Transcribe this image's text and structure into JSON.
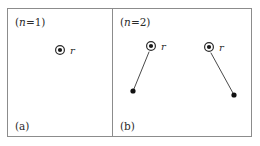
{
  "figure": {
    "width": 260,
    "height": 146,
    "background_color": "#ffffff",
    "border_color": "#8c8c8c",
    "marker_color": "#1a1a1a",
    "line_color": "#4a4a4a"
  },
  "panels": [
    {
      "id": "panel-a",
      "sub_label": "(a)",
      "n_label_open": "(",
      "n_label_var": "n",
      "n_label_rest": "=1)",
      "n_label_full": "(n=1)",
      "markers": [
        {
          "id": "marker-a-1",
          "x": 60,
          "y": 50,
          "label": "r",
          "label_x": 70,
          "label_y": 53.5
        }
      ],
      "connectors": []
    },
    {
      "id": "panel-b",
      "sub_label": "(b)",
      "n_label_open": "(",
      "n_label_var": "n",
      "n_label_rest": "=2)",
      "n_label_full": "(n=2)",
      "markers": [
        {
          "id": "marker-b-1",
          "x": 151,
          "y": 46,
          "label": "r",
          "label_x": 161,
          "label_y": 49.5
        },
        {
          "id": "marker-b-2",
          "x": 209,
          "y": 47,
          "label": "r",
          "label_x": 219,
          "label_y": 50.5
        }
      ],
      "endpoints": [
        {
          "id": "endpoint-b-1",
          "x": 133,
          "y": 91
        },
        {
          "id": "endpoint-b-2",
          "x": 234,
          "y": 95
        }
      ],
      "connectors": [
        {
          "id": "connector-b-1",
          "x1": 149,
          "y1": 52,
          "x2": 133.5,
          "y2": 90
        },
        {
          "id": "connector-b-2",
          "x1": 211,
          "y1": 53,
          "x2": 233.5,
          "y2": 94
        }
      ]
    }
  ],
  "geometry": {
    "frame": {
      "x": 7.5,
      "y": 8.5,
      "width": 244,
      "height": 128
    },
    "divider_x": 112.5,
    "divider_y1": 8.5,
    "divider_y2": 136.5,
    "label_positions": {
      "n1": {
        "x": 15,
        "y": 26
      },
      "n2": {
        "x": 120,
        "y": 26
      },
      "a": {
        "x": 15,
        "y": 130
      },
      "b": {
        "x": 120,
        "y": 130
      }
    },
    "marker_ring_radius": 4.4,
    "marker_core_radius": 2.1,
    "plain_dot_radius": 2.6
  }
}
